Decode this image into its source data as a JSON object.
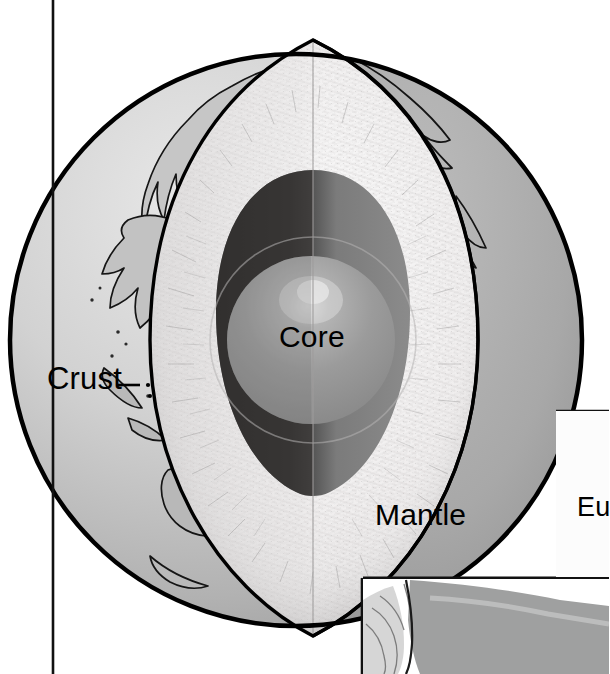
{
  "figure": {
    "type": "cutaway-diagram",
    "style": "grayscale line-and-tone illustration",
    "width": 609,
    "height": 674
  },
  "labels": {
    "crust": "Crust",
    "core": "Core",
    "mantle": "Mantle",
    "neighbor_panel_text": "Eu"
  },
  "layers": [
    {
      "name": "Crust",
      "label": "Crust",
      "order": 1,
      "color": "#a6a6a6",
      "description": "thin outer shell shown as a dark gray cut band with continental outlines on the sphere surface"
    },
    {
      "name": "Mantle",
      "label": "Mantle",
      "order": 2,
      "color": "#eceaea",
      "description": "thick light, hatch-textured layer between crust and core"
    },
    {
      "name": "Core",
      "label": "Core",
      "order": 3,
      "color": "#8e8e8e",
      "description": "dark outer core with a lighter highlighted inner sphere"
    }
  ],
  "annotations": [
    {
      "id": "crust-leader",
      "label": "Crust",
      "style": "dashed-leader-line",
      "points_to": "crust band"
    }
  ],
  "colors": {
    "background": "#ffffff",
    "outline": "#000000",
    "surface_light": "#d8d8d8",
    "surface_mid": "#bdbdbd",
    "crust_band": "#a8a8a8",
    "mantle_light": "#f2f0f0",
    "mantle_shadow": "#d9d7d7",
    "outer_core_dark": "#3a3a3a",
    "outer_core_mid": "#7d7d7d",
    "inner_core": "#9a9a9a",
    "inner_core_highlight": "#d2d2d2",
    "panel_fill": "#fbfbfb",
    "neighbor_figure_gray": "#9c9c9c",
    "neighbor_figure_light": "#d4d4d4",
    "rule": "#111111"
  },
  "rules": {
    "left_vertical_x": 53,
    "panel_top_y": 410,
    "panel_bottom_y": 578,
    "bottom_divider_x": 362
  },
  "geometry": {
    "globe_center_x": 296,
    "globe_center_y": 340,
    "globe_radius": 286,
    "wedge_apex_x": 313,
    "wedge_apex_y": 40,
    "cut_line_x": 313
  }
}
